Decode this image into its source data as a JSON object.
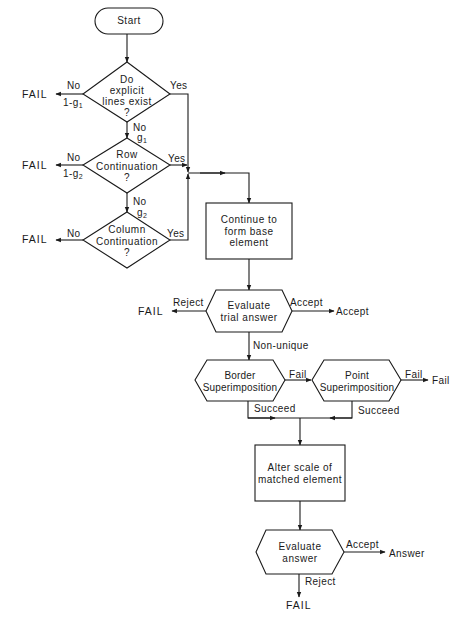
{
  "diagram": {
    "type": "flowchart",
    "nodes": {
      "start": {
        "label": "Start",
        "shape": "terminator"
      },
      "explicit_lines": {
        "line1": "Do",
        "line2": "explicit",
        "line3": "lines exist",
        "line4": "?",
        "shape": "diamond"
      },
      "row_continuation": {
        "line1": "Row",
        "line2": "Continuation",
        "line3": "?",
        "shape": "diamond"
      },
      "column_continuation": {
        "line1": "Column",
        "line2": "Continuation",
        "line3": "?",
        "shape": "diamond"
      },
      "form_base": {
        "line1": "Continue to",
        "line2": "form base",
        "line3": "element",
        "shape": "rectangle"
      },
      "evaluate_trial": {
        "line1": "Evaluate",
        "line2": "trial answer",
        "shape": "hexagon"
      },
      "border_super": {
        "line1": "Border",
        "line2": "Superimposition",
        "shape": "hexagon"
      },
      "point_super": {
        "line1": "Point",
        "line2": "Superimposition",
        "shape": "hexagon"
      },
      "alter_scale": {
        "line1": "Alter scale of",
        "line2": "matched element",
        "shape": "rectangle"
      },
      "evaluate_answer": {
        "line1": "Evaluate",
        "line2": "answer",
        "shape": "hexagon"
      }
    },
    "edge_labels": {
      "d1_no": "No",
      "d1_no_prob": "1-g",
      "d1_no_prob_sub": "1",
      "d1_yes": "Yes",
      "d1_down_no": "No",
      "d1_down_prob": "g",
      "d1_down_prob_sub": "1",
      "d2_no": "No",
      "d2_no_prob": "1-g",
      "d2_no_prob_sub": "2",
      "d2_yes": "Yes",
      "d2_down_no": "No",
      "d2_down_prob": "g",
      "d2_down_prob_sub": "2",
      "d3_no": "No",
      "d3_yes": "Yes",
      "trial_reject": "Reject",
      "trial_accept": "Accept",
      "trial_nonunique": "Non-unique",
      "border_fail": "Fail",
      "border_succeed": "Succeed",
      "point_fail": "Fail",
      "point_succeed": "Succeed",
      "answer_accept": "Accept",
      "answer_reject": "Reject"
    },
    "terminals": {
      "fail1": "FAIL",
      "fail2": "FAIL",
      "fail3": "FAIL",
      "fail4": "FAIL",
      "accept": "Accept",
      "fail_point": "Fail",
      "answer": "Answer",
      "fail_final": "FAIL"
    },
    "colors": {
      "ink": "#1a1a1a",
      "background": "#ffffff"
    }
  }
}
